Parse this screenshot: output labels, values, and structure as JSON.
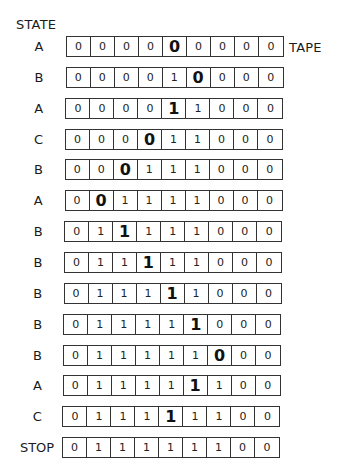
{
  "labels": {
    "state_header": "STATE",
    "tape_label": "TAPE"
  },
  "rows": [
    {
      "state": "A",
      "head": 4,
      "cells": [
        "0",
        "0",
        "0",
        "0",
        "0",
        "0",
        "0",
        "0",
        "0"
      ]
    },
    {
      "state": "B",
      "head": 5,
      "cells": [
        "0",
        "0",
        "0",
        "0",
        "1",
        "0",
        "0",
        "0",
        "0"
      ]
    },
    {
      "state": "A",
      "head": 4,
      "cells": [
        "0",
        "0",
        "0",
        "0",
        "1",
        "1",
        "0",
        "0",
        "0"
      ]
    },
    {
      "state": "C",
      "head": 3,
      "cells": [
        "0",
        "0",
        "0",
        "0",
        "1",
        "1",
        "0",
        "0",
        "0"
      ]
    },
    {
      "state": "B",
      "head": 2,
      "cells": [
        "0",
        "0",
        "0",
        "1",
        "1",
        "1",
        "0",
        "0",
        "0"
      ]
    },
    {
      "state": "A",
      "head": 1,
      "cells": [
        "0",
        "0",
        "1",
        "1",
        "1",
        "1",
        "0",
        "0",
        "0"
      ]
    },
    {
      "state": "B",
      "head": 2,
      "cells": [
        "0",
        "1",
        "1",
        "1",
        "1",
        "1",
        "0",
        "0",
        "0"
      ]
    },
    {
      "state": "B",
      "head": 3,
      "cells": [
        "0",
        "1",
        "1",
        "1",
        "1",
        "1",
        "0",
        "0",
        "0"
      ]
    },
    {
      "state": "B",
      "head": 4,
      "cells": [
        "0",
        "1",
        "1",
        "1",
        "1",
        "1",
        "0",
        "0",
        "0"
      ]
    },
    {
      "state": "B",
      "head": 5,
      "cells": [
        "0",
        "1",
        "1",
        "1",
        "1",
        "1",
        "0",
        "0",
        "0"
      ]
    },
    {
      "state": "B",
      "head": 6,
      "cells": [
        "0",
        "1",
        "1",
        "1",
        "1",
        "1",
        "0",
        "0",
        "0"
      ]
    },
    {
      "state": "A",
      "head": 5,
      "cells": [
        "0",
        "1",
        "1",
        "1",
        "1",
        "1",
        "1",
        "0",
        "0"
      ]
    },
    {
      "state": "C",
      "head": 4,
      "cells": [
        "0",
        "1",
        "1",
        "1",
        "1",
        "1",
        "1",
        "0",
        "0"
      ]
    },
    {
      "state": "STOP",
      "head": null,
      "cells": [
        "0",
        "1",
        "1",
        "1",
        "1",
        "1",
        "1",
        "0",
        "0"
      ]
    }
  ],
  "colors": {
    "border": "#333333",
    "text": "#1a1a1a",
    "background": "#ffffff"
  }
}
